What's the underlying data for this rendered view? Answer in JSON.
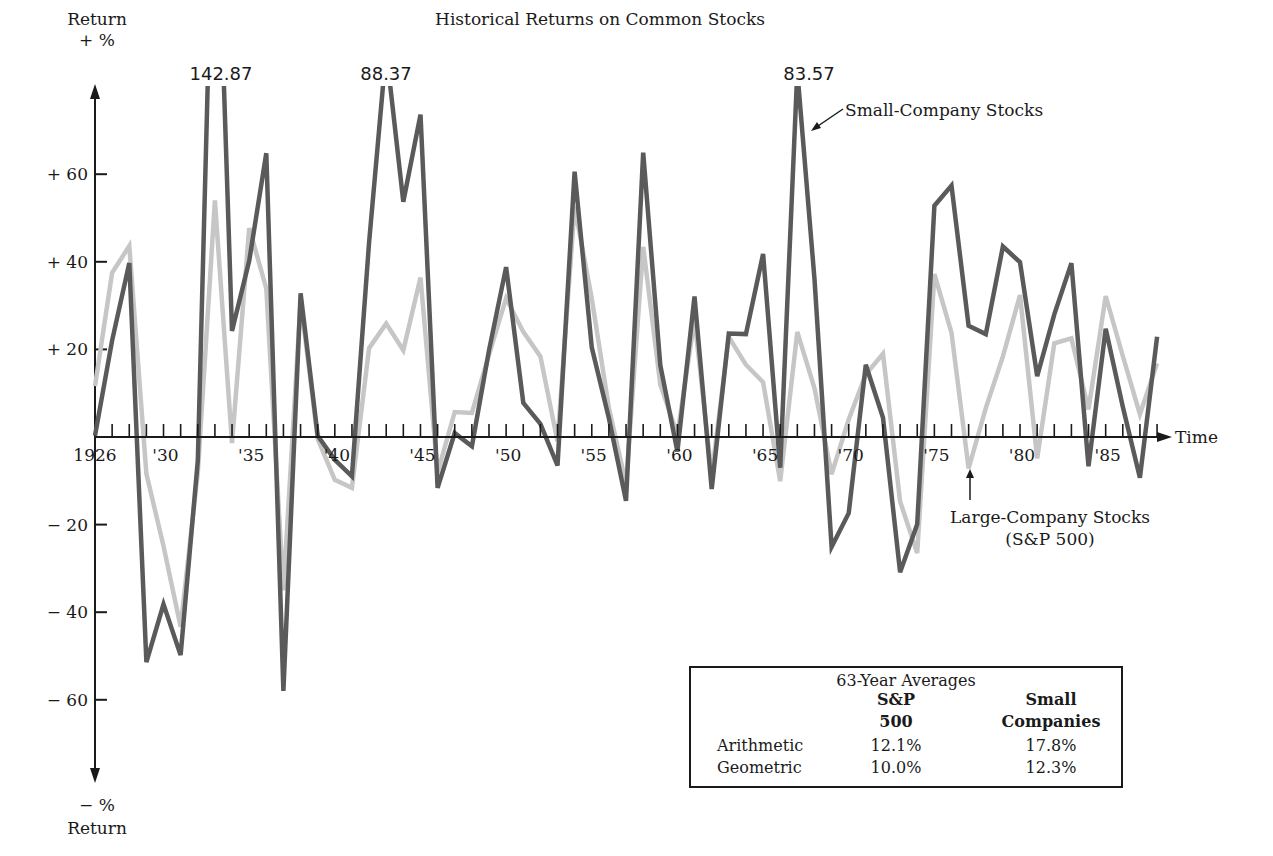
{
  "chart_data": {
    "type": "line",
    "title": "Historical Returns on Common Stocks",
    "xlabel": "Time",
    "ylabel_top": "Return",
    "ylabel_top_unit": "+ %",
    "ylabel_bottom_unit": "− %",
    "ylabel_bottom": "Return",
    "ylim": [
      -75,
      80
    ],
    "yticks": [
      {
        "value": 60,
        "label": "+ 60"
      },
      {
        "value": 40,
        "label": "+ 40"
      },
      {
        "value": 20,
        "label": "+ 20"
      },
      {
        "value": -20,
        "label": "− 20"
      },
      {
        "value": -40,
        "label": "− 40"
      },
      {
        "value": -60,
        "label": "− 60"
      }
    ],
    "xtick_labels": [
      {
        "year": 1926,
        "label": "1926"
      },
      {
        "year": 1930,
        "label": "'30"
      },
      {
        "year": 1935,
        "label": "'35"
      },
      {
        "year": 1940,
        "label": "'40"
      },
      {
        "year": 1945,
        "label": "'45"
      },
      {
        "year": 1950,
        "label": "'50"
      },
      {
        "year": 1955,
        "label": "'55"
      },
      {
        "year": 1960,
        "label": "'60"
      },
      {
        "year": 1965,
        "label": "'65"
      },
      {
        "year": 1970,
        "label": "'70"
      },
      {
        "year": 1975,
        "label": "'75"
      },
      {
        "year": 1980,
        "label": "'80"
      },
      {
        "year": 1985,
        "label": "'85"
      }
    ],
    "grid": false,
    "x_start": 1926,
    "x_end": 1988,
    "series": [
      {
        "name": "Large-Company Stocks (S&P 500)",
        "color": "#c6c6c6",
        "values": [
          11.6,
          37.5,
          43.6,
          -8.4,
          -24.9,
          -43.3,
          -8.2,
          54.0,
          -1.4,
          47.7,
          33.9,
          -35.0,
          31.1,
          -0.4,
          -9.8,
          -11.6,
          20.3,
          25.9,
          19.8,
          36.4,
          -8.1,
          5.7,
          5.5,
          18.8,
          31.7,
          24.0,
          18.4,
          -1.0,
          52.6,
          31.6,
          6.6,
          -10.8,
          43.4,
          12.0,
          0.5,
          26.9,
          -8.7,
          22.8,
          16.5,
          12.5,
          -10.1,
          24.0,
          11.1,
          -8.5,
          4.0,
          14.3,
          19.0,
          -14.7,
          -26.5,
          37.2,
          23.8,
          -7.2,
          6.6,
          18.4,
          32.4,
          -4.9,
          21.4,
          22.5,
          6.3,
          32.2,
          18.5,
          5.2,
          16.8
        ]
      },
      {
        "name": "Small-Company Stocks",
        "color": "#5a5a5a",
        "values": [
          0.3,
          22.0,
          39.7,
          -51.4,
          -38.2,
          -49.8,
          -5.4,
          142.87,
          24.2,
          40.2,
          64.8,
          -58.0,
          32.8,
          0.3,
          -5.2,
          -9.0,
          44.5,
          88.37,
          53.7,
          73.6,
          -11.6,
          0.9,
          -2.1,
          19.8,
          38.8,
          7.8,
          3.0,
          -6.5,
          60.6,
          20.4,
          4.3,
          -14.6,
          64.9,
          16.4,
          -3.3,
          32.1,
          -11.9,
          23.6,
          23.5,
          41.8,
          -7.0,
          83.57,
          36.0,
          -25.1,
          -17.4,
          16.5,
          4.4,
          -30.9,
          -19.9,
          52.8,
          57.4,
          25.4,
          23.5,
          43.5,
          39.9,
          13.9,
          28.0,
          39.7,
          -6.7,
          24.7,
          6.9,
          -9.3,
          22.9
        ]
      }
    ],
    "annotations": [
      {
        "text": "142.87",
        "year": 1933,
        "series": "Small-Company Stocks"
      },
      {
        "text": "88.37",
        "year": 1943,
        "series": "Small-Company Stocks"
      },
      {
        "text": "83.57",
        "year": 1967,
        "series": "Small-Company Stocks"
      },
      {
        "text": "Small-Company Stocks",
        "type": "series-label",
        "arrow_to_year": 1967.5
      },
      {
        "text": "Large-Company Stocks",
        "text2": "(S&P 500)",
        "type": "series-label",
        "arrow_to_year": 1977
      }
    ],
    "legend_position": "inline-annotations",
    "averages_table": {
      "title": "63-Year Averages",
      "columns": [
        "",
        "S&P 500",
        "Small Companies"
      ],
      "rows": [
        {
          "label": "Arithmetic",
          "sp500": "12.1%",
          "small": "17.8%"
        },
        {
          "label": "Geometric",
          "sp500": "10.0%",
          "small": "12.3%"
        }
      ]
    }
  },
  "labels": {
    "title": "Historical Returns on Common Stocks",
    "y_top": "Return",
    "y_top_unit": "+ %",
    "y_bottom_unit": "− %",
    "y_bottom": "Return",
    "x_axis": "Time",
    "peak_1": "142.87",
    "peak_2": "88.37",
    "peak_3": "83.57",
    "small_series": "Small-Company Stocks",
    "large_series_line1": "Large-Company Stocks",
    "large_series_line2": "(S&P 500)"
  },
  "table": {
    "title": "63-Year Averages",
    "col_sp_line1": "S&P",
    "col_sp_line2": "500",
    "col_sc_line1": "Small",
    "col_sc_line2": "Companies",
    "row1_label": "Arithmetic",
    "row1_sp": "12.1%",
    "row1_sc": "17.8%",
    "row2_label": "Geometric",
    "row2_sp": "10.0%",
    "row2_sc": "12.3%"
  }
}
